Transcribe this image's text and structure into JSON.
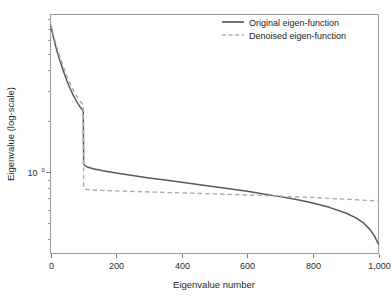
{
  "chart_data": {
    "type": "line",
    "title": "",
    "xlabel": "Eigenvalue number",
    "ylabel": "Eigenvalue (log-scale)",
    "yscale": "log",
    "xlim": [
      0,
      1000
    ],
    "ylim": [
      0.33,
      8.5
    ],
    "grid": false,
    "legend_position": "top-right",
    "xticks": [
      0,
      200,
      400,
      600,
      800,
      1000
    ],
    "xtick_labels": [
      "0",
      "200",
      "400",
      "600",
      "800",
      "1,000"
    ],
    "yticks": [
      1
    ],
    "ytick_labels": [
      "10"
    ],
    "ytick_exponents": [
      "0"
    ],
    "annotations": [],
    "series": [
      {
        "name": "Original eigen-function",
        "style": "solid",
        "color": "#555a5f",
        "x": [
          1,
          10,
          20,
          30,
          40,
          50,
          60,
          70,
          80,
          90,
          95,
          99,
          100,
          101,
          105,
          115,
          130,
          160,
          200,
          250,
          300,
          350,
          400,
          450,
          500,
          550,
          600,
          650,
          700,
          750,
          800,
          850,
          900,
          930,
          955,
          975,
          988,
          996,
          1000
        ],
        "y": [
          7.3,
          6.1,
          5.15,
          4.45,
          3.9,
          3.45,
          3.1,
          2.82,
          2.6,
          2.42,
          2.36,
          2.3,
          2.28,
          1.12,
          1.09,
          1.065,
          1.045,
          1.015,
          0.985,
          0.952,
          0.922,
          0.895,
          0.868,
          0.842,
          0.818,
          0.793,
          0.768,
          0.742,
          0.715,
          0.687,
          0.655,
          0.618,
          0.572,
          0.537,
          0.498,
          0.455,
          0.418,
          0.388,
          0.375
        ]
      },
      {
        "name": "Denoised eigen-function",
        "style": "dashed",
        "color": "#a9adb1",
        "x": [
          1,
          10,
          20,
          30,
          40,
          50,
          60,
          70,
          80,
          90,
          95,
          99,
          100,
          101,
          104,
          110,
          120,
          140,
          170,
          210,
          260,
          320,
          380,
          440,
          500,
          560,
          620,
          680,
          740,
          800,
          860,
          910,
          950,
          980,
          1000
        ],
        "y": [
          7.45,
          6.35,
          5.4,
          4.7,
          4.12,
          3.68,
          3.32,
          3.02,
          2.8,
          2.62,
          2.55,
          2.5,
          2.48,
          0.808,
          0.795,
          0.788,
          0.784,
          0.78,
          0.776,
          0.772,
          0.766,
          0.76,
          0.754,
          0.748,
          0.742,
          0.736,
          0.729,
          0.722,
          0.714,
          0.706,
          0.697,
          0.689,
          0.682,
          0.677,
          0.673
        ]
      }
    ]
  },
  "legend": {
    "entries": [
      {
        "label": "Original eigen-function"
      },
      {
        "label": "Denoised eigen-function"
      }
    ]
  },
  "axes": {
    "x_title": "Eigenvalue number",
    "y_title": "Eigenvalue (log-scale)"
  }
}
